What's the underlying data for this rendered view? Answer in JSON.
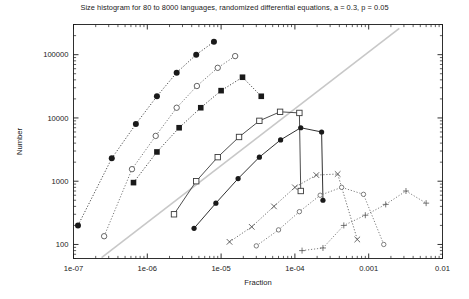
{
  "chart": {
    "title": "Size histogram for 80 to 8000 languages, randomized differential equations, a = 0.3, p = 0.05",
    "xlabel": "Fraction",
    "ylabel": "Number"
  },
  "chart_data": {
    "type": "scatter",
    "title": "Size histogram for 80 to 8000 languages, randomized differential equations, a = 0.3, p = 0.05",
    "xlabel": "Fraction",
    "ylabel": "Number",
    "xscale": "log",
    "yscale": "log",
    "xlim": [
      1e-07,
      0.01
    ],
    "ylim": [
      60,
      300000
    ],
    "grid": false,
    "legend": "none",
    "xticks": [
      "1e-07",
      "1e-06",
      "1e-05",
      "1e-04",
      "0.001",
      "0.01"
    ],
    "xtick_values": [
      1e-07,
      1e-06,
      1e-05,
      0.0001,
      0.001,
      0.01
    ],
    "yticks": [
      "100",
      "1000",
      "10000",
      "100000"
    ],
    "ytick_values": [
      100,
      1000,
      10000,
      100000
    ],
    "reference_line": {
      "label": "diagonal guide",
      "color": "#c8c8c8",
      "x": [
        2.4e-07,
        0.0026
      ],
      "y": [
        62,
        260000
      ]
    },
    "series": [
      {
        "name": "80 languages",
        "marker": "filled-circle",
        "linestyle": "dotted",
        "color": "#1a1a1a",
        "x": [
          1.15e-07,
          3.3e-07,
          7e-07,
          1.35e-06,
          2.5e-06,
          4.6e-06,
          8e-06
        ],
        "y": [
          200,
          2300,
          8000,
          22000,
          52000,
          100000,
          160000
        ]
      },
      {
        "name": "200 languages",
        "marker": "open-circle",
        "linestyle": "dotted",
        "color": "#555555",
        "x": [
          2.6e-07,
          6.2e-07,
          1.3e-06,
          2.5e-06,
          4.7e-06,
          9e-06,
          1.55e-05
        ],
        "y": [
          135,
          1550,
          5200,
          14500,
          32000,
          62000,
          95000
        ]
      },
      {
        "name": "500 languages",
        "marker": "filled-square",
        "linestyle": "dotted",
        "color": "#1a1a1a",
        "x": [
          6.5e-07,
          1.35e-06,
          2.7e-06,
          5.3e-06,
          1e-05,
          1.95e-05,
          3.5e-05
        ],
        "y": [
          950,
          2900,
          7000,
          14500,
          27000,
          44000,
          22000
        ]
      },
      {
        "name": "1000 languages",
        "marker": "open-square",
        "linestyle": "solid",
        "color": "#3a3a3a",
        "x": [
          2.3e-06,
          4.6e-06,
          9e-06,
          1.75e-05,
          3.3e-05,
          6.3e-05,
          0.000115,
          0.00012
        ],
        "y": [
          300,
          1000,
          2400,
          5000,
          9000,
          12500,
          12000,
          700
        ]
      },
      {
        "name": "2000 languages",
        "marker": "filled-circle-solid",
        "linestyle": "solid",
        "color": "#1a1a1a",
        "x": [
          4.3e-06,
          8.5e-06,
          1.7e-05,
          3.3e-05,
          6.4e-05,
          0.00012,
          0.00023,
          0.00024
        ],
        "y": [
          180,
          450,
          1100,
          2400,
          4500,
          7000,
          6000,
          500
        ]
      },
      {
        "name": "4000 languages",
        "marker": "cross-x",
        "linestyle": "dotted",
        "color": "#4a4a4a",
        "x": [
          1.3e-05,
          2.6e-05,
          5.2e-05,
          0.0001,
          0.000195,
          0.00038,
          0.0007
        ],
        "y": [
          110,
          190,
          400,
          800,
          1250,
          1300,
          120
        ]
      },
      {
        "name": "6000 languages",
        "marker": "open-circle-small",
        "linestyle": "dotted",
        "color": "#606060",
        "x": [
          3e-05,
          6e-05,
          0.000115,
          0.00022,
          0.00043,
          0.00085,
          0.0016
        ],
        "y": [
          95,
          170,
          330,
          600,
          800,
          620,
          100
        ]
      },
      {
        "name": "8000 languages",
        "marker": "plus",
        "linestyle": "dotted",
        "color": "#606060",
        "x": [
          0.000125,
          0.00024,
          0.00046,
          0.0009,
          0.0017,
          0.0032,
          0.006
        ],
        "y": [
          80,
          88,
          200,
          290,
          430,
          700,
          450
        ]
      }
    ]
  }
}
